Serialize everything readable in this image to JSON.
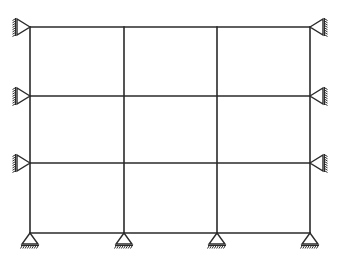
{
  "diagram": {
    "title": "",
    "type": "multi-storey plane frame with pinned supports",
    "colors": {
      "line": "#2a2a2a",
      "background": "#ffffff"
    },
    "columns_x": [
      30,
      124,
      217,
      310
    ],
    "beams_y": [
      27,
      96,
      163,
      233
    ],
    "bays": 3,
    "storeys": 3,
    "supports": {
      "left": [
        {
          "y": 27,
          "type": "pin",
          "orientation": "right"
        },
        {
          "y": 96,
          "type": "pin",
          "orientation": "right"
        },
        {
          "y": 163,
          "type": "pin",
          "orientation": "right"
        }
      ],
      "right": [
        {
          "y": 27,
          "type": "pin",
          "orientation": "left"
        },
        {
          "y": 96,
          "type": "pin",
          "orientation": "left"
        },
        {
          "y": 163,
          "type": "pin",
          "orientation": "left"
        }
      ],
      "bottom": [
        {
          "x": 30,
          "type": "pin"
        },
        {
          "x": 124,
          "type": "pin"
        },
        {
          "x": 217,
          "type": "pin"
        },
        {
          "x": 310,
          "type": "pin"
        }
      ]
    },
    "labels": []
  }
}
